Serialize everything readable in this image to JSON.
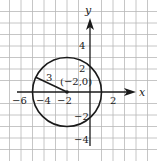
{
  "diagram": {
    "type": "coordinate-plane-circle",
    "axes": {
      "x_label": "x",
      "y_label": "y",
      "x_ticks": [
        {
          "value": -6,
          "label": "−6"
        },
        {
          "value": -4,
          "label": "−4"
        },
        {
          "value": -2,
          "label": "−2"
        },
        {
          "value": 2,
          "label": "2"
        }
      ],
      "y_ticks": [
        {
          "value": 4,
          "label": "4"
        },
        {
          "value": 2,
          "label": "2"
        },
        {
          "value": -2,
          "label": "−2"
        },
        {
          "value": -4,
          "label": "−4"
        }
      ]
    },
    "circle": {
      "center": {
        "x": -2,
        "y": 0
      },
      "center_label": "(−2,0)",
      "radius": 3,
      "radius_label": "3"
    },
    "grid": {
      "visible": true,
      "unit": 1
    },
    "colors": {
      "grid": "#b8b8b8",
      "ink": "#1a1a1a",
      "background": "#ffffff"
    }
  }
}
